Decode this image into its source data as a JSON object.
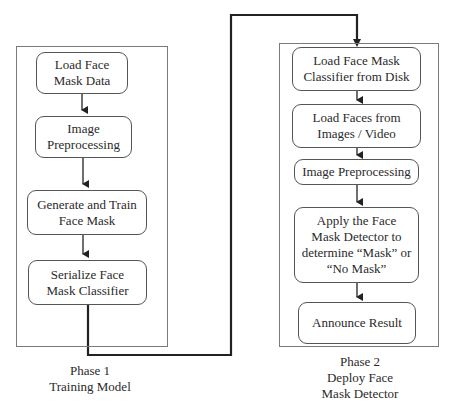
{
  "diagram": {
    "phase1": {
      "caption_line1": "Phase 1",
      "caption_line2": "Training Model",
      "steps": [
        {
          "line1": "Load Face",
          "line2": "Mask Data"
        },
        {
          "line1": "Image",
          "line2": "Preprocessing"
        },
        {
          "line1": "Generate and Train",
          "line2": "Face Mask"
        },
        {
          "line1": "Serialize Face",
          "line2": "Mask Classifier"
        }
      ]
    },
    "phase2": {
      "caption_line1": "Phase 2",
      "caption_line2": "Deploy Face",
      "caption_line3": "Mask Detector",
      "steps": [
        {
          "line1": "Load Face Mask",
          "line2": "Classifier from Disk"
        },
        {
          "line1": "Load Faces from",
          "line2": "Images / Video"
        },
        {
          "line1": "Image Preprocessing"
        },
        {
          "line1": "Apply the Face",
          "line2": "Mask Detector to",
          "line3": "determine “Mask” or",
          "line4": "“No Mask”"
        },
        {
          "line1": "Announce Result"
        }
      ]
    },
    "colors": {
      "line": "#222222",
      "box_border": "#555555",
      "frame_border": "#7a7a7a"
    }
  }
}
